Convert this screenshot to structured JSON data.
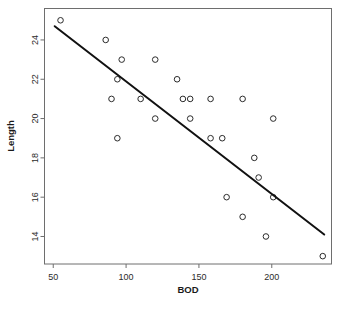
{
  "chart_data": {
    "type": "scatter",
    "title": "",
    "xlabel": "BOD",
    "ylabel": "Length",
    "xlim": [
      44,
      241
    ],
    "ylim": [
      12.6,
      25.6
    ],
    "xticks": [
      50,
      100,
      150,
      200
    ],
    "xtick_labels": [
      "50",
      "100",
      "150",
      "200"
    ],
    "yticks": [
      14,
      16,
      18,
      20,
      22,
      24
    ],
    "ytick_labels": [
      "14",
      "16",
      "18",
      "20",
      "22",
      "24"
    ],
    "grid": false,
    "legend": null,
    "marker": "open-circle",
    "x": [
      55,
      86,
      97,
      120,
      94,
      135,
      90,
      110,
      139,
      144,
      158,
      180,
      120,
      144,
      201,
      94,
      158,
      166,
      188,
      191,
      169,
      201,
      180,
      196,
      235
    ],
    "y": [
      25,
      24,
      23,
      23,
      22,
      22,
      21,
      21,
      21,
      21,
      21,
      21,
      20,
      20,
      20,
      19,
      19,
      19,
      18,
      17,
      16,
      16,
      15,
      14,
      13
    ],
    "points": [
      {
        "x": 55,
        "y": 25
      },
      {
        "x": 86,
        "y": 24
      },
      {
        "x": 97,
        "y": 23
      },
      {
        "x": 120,
        "y": 23
      },
      {
        "x": 94,
        "y": 22
      },
      {
        "x": 135,
        "y": 22
      },
      {
        "x": 90,
        "y": 21
      },
      {
        "x": 110,
        "y": 21
      },
      {
        "x": 139,
        "y": 21
      },
      {
        "x": 144,
        "y": 21
      },
      {
        "x": 158,
        "y": 21
      },
      {
        "x": 180,
        "y": 21
      },
      {
        "x": 120,
        "y": 20
      },
      {
        "x": 144,
        "y": 20
      },
      {
        "x": 201,
        "y": 20
      },
      {
        "x": 94,
        "y": 19
      },
      {
        "x": 158,
        "y": 19
      },
      {
        "x": 166,
        "y": 19
      },
      {
        "x": 188,
        "y": 18
      },
      {
        "x": 191,
        "y": 17
      },
      {
        "x": 169,
        "y": 16
      },
      {
        "x": 201,
        "y": 16
      },
      {
        "x": 180,
        "y": 15
      },
      {
        "x": 196,
        "y": 14
      },
      {
        "x": 235,
        "y": 13
      }
    ],
    "fit_line": {
      "type": "linear-regression",
      "x_start": 51,
      "y_start": 24.7,
      "x_end": 236,
      "y_end": 14.1
    },
    "colors": {
      "marker_stroke": "#2b2b2b",
      "line": "#111111",
      "frame": "#6e6e6e",
      "text": "#1a1a1a",
      "background": "#ffffff"
    }
  }
}
